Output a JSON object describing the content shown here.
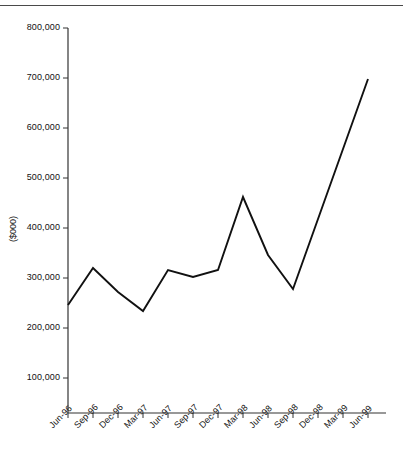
{
  "figure": {
    "clipped_title": "",
    "ylabel": "($000)",
    "xlabel": ""
  },
  "chart_data": {
    "type": "line",
    "title": "",
    "xlabel": "",
    "ylabel": "($000)",
    "ylim": [
      0,
      800000
    ],
    "yticks": [
      100000,
      200000,
      300000,
      400000,
      500000,
      600000,
      700000,
      800000
    ],
    "ytick_labels": [
      "100,000",
      "200,000",
      "300,000",
      "400,000",
      "500,000",
      "600,000",
      "700,000",
      "800,000"
    ],
    "grid": false,
    "legend": false,
    "legend_position": "none",
    "categories": [
      "Jun-96",
      "Sep-96",
      "Dec-96",
      "Mar-97",
      "Jun-97",
      "Sep-97",
      "Dec-97",
      "Mar-98",
      "Jun-98",
      "Sep-98",
      "Dec-98",
      "Mar-99",
      "Jun-99"
    ],
    "series": [
      {
        "name": "Value",
        "color": "#111111",
        "values": [
          246000,
          320000,
          272000,
          234000,
          316000,
          302000,
          316000,
          462000,
          346000,
          278000,
          418000,
          558000,
          698000
        ]
      }
    ]
  },
  "style": {
    "line_color": "#111111",
    "axis_color": "#333333",
    "background": "#ffffff"
  }
}
